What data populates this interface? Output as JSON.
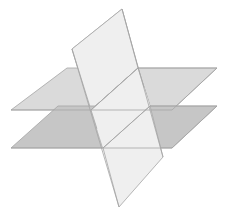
{
  "diagram": {
    "colors": {
      "background": "#ffffff",
      "vertical_plane": "#efefef",
      "upper_plane": "#dadada",
      "lower_plane": "#c6c6c6",
      "edge": "#a4a4a4"
    },
    "shapes": {
      "vertical_plane_back": "72,49 122,9 138,68 91,110",
      "upper_plane": "67,68 217,68 172,110 11,110",
      "vertical_plane_mid": "91,110 138,68 150,106 103,148",
      "lower_plane": "58,106 217,106 172,148 11,148",
      "vertical_plane_front": "103,148 150,106 163,157 119,207",
      "upper_plane_front_left": "11,110 91,110 80,68 67,68",
      "intersection_upper": "91,110 138,68",
      "intersection_lower": "103,148 150,106"
    }
  }
}
